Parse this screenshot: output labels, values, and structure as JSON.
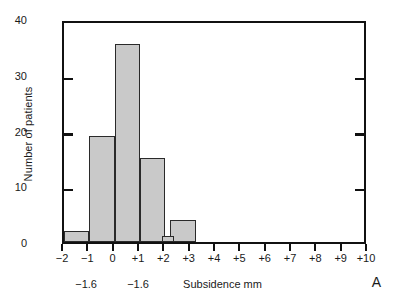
{
  "chart_data": {
    "type": "bar",
    "title": "",
    "xlabel": "Subsidence mm",
    "ylabel": "Number of patients",
    "panel_label": "A",
    "xlim": [
      -2,
      10
    ],
    "ylim": [
      0,
      40
    ],
    "yticks": [
      0,
      10,
      20,
      30,
      40
    ],
    "ytick_labels": [
      "0",
      "10",
      "20",
      "30",
      "40"
    ],
    "xticks": [
      -2,
      -1,
      0,
      1,
      2,
      3,
      4,
      5,
      6,
      7,
      8,
      9,
      10
    ],
    "xtick_labels": [
      "−2",
      "−1",
      "0",
      "+1",
      "+2",
      "+3",
      "+4",
      "+5",
      "+6",
      "+7",
      "+8",
      "+9",
      "+10"
    ],
    "grid": false,
    "legend": false,
    "bin_width": 1,
    "bins": [
      {
        "label": "−2 to −1",
        "x0": -2,
        "x1": -1,
        "value": 2
      },
      {
        "label": "−1 to 0",
        "x0": -1,
        "x1": 0,
        "value": 19
      },
      {
        "label": "0 to +1",
        "x0": 0,
        "x1": 1,
        "value": 35.5
      },
      {
        "label": "+1 to +2",
        "x0": 1,
        "x1": 2,
        "value": 15
      },
      {
        "label": "+2 (narrow)",
        "x0": 1.85,
        "x1": 2.35,
        "value": 1
      },
      {
        "label": "+2 to +3",
        "x0": 2.2,
        "x1": 3.2,
        "value": 4
      }
    ],
    "bar_fill_color": "#c9c9c9",
    "bar_edge_color": "#2a2a2a",
    "axis_color": "#111111"
  },
  "annotations": [
    {
      "id": "annot-left",
      "text": "−1.6",
      "x": -1.05
    },
    {
      "id": "annot-right",
      "text": "−1.6",
      "x": 1.0
    }
  ]
}
